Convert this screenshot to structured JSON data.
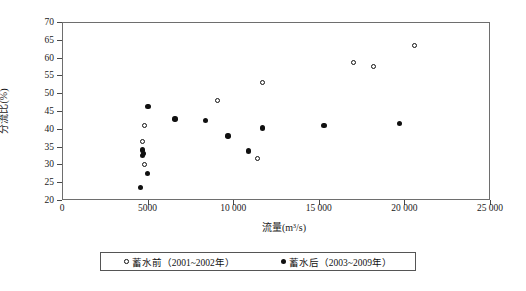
{
  "chart_data": {
    "type": "scatter",
    "title": "",
    "xlabel": "流量(m³/s)",
    "ylabel": "分流比(%)",
    "xlim": [
      0,
      25000
    ],
    "ylim": [
      20,
      70
    ],
    "xticks": [
      0,
      5000,
      10000,
      15000,
      20000,
      25000
    ],
    "xtick_labels": [
      "0",
      "5000",
      "10 000",
      "15 000",
      "20 000",
      "25 000"
    ],
    "yticks": [
      20,
      25,
      30,
      35,
      40,
      45,
      50,
      55,
      60,
      65,
      70
    ],
    "ytick_labels": [
      "20",
      "25",
      "30",
      "35",
      "40",
      "45",
      "50",
      "55",
      "60",
      "65",
      "70"
    ],
    "grid": false,
    "legend_position": "below-axes",
    "series": [
      {
        "name": "蓄水前（2001~2002年）",
        "marker": "open-circle",
        "color": "#101010",
        "points": [
          {
            "x": 4800,
            "y": 41.0
          },
          {
            "x": 4730,
            "y": 36.5
          },
          {
            "x": 4800,
            "y": 30.0
          },
          {
            "x": 9100,
            "y": 48.0
          },
          {
            "x": 11400,
            "y": 31.7
          },
          {
            "x": 11700,
            "y": 53.0
          },
          {
            "x": 17000,
            "y": 58.5
          },
          {
            "x": 18200,
            "y": 57.5
          },
          {
            "x": 20600,
            "y": 63.5
          }
        ]
      },
      {
        "name": "蓄水后（2003~2009年）",
        "marker": "filled-circle",
        "color": "#101010",
        "points": [
          {
            "x": 5020,
            "y": 46.2
          },
          {
            "x": 4700,
            "y": 34.0
          },
          {
            "x": 4760,
            "y": 33.0
          },
          {
            "x": 4720,
            "y": 32.5
          },
          {
            "x": 5000,
            "y": 27.5
          },
          {
            "x": 4600,
            "y": 23.5
          },
          {
            "x": 6600,
            "y": 42.7
          },
          {
            "x": 8400,
            "y": 42.3
          },
          {
            "x": 9700,
            "y": 38.0
          },
          {
            "x": 10900,
            "y": 33.8
          },
          {
            "x": 11700,
            "y": 40.2
          },
          {
            "x": 15300,
            "y": 41.0
          },
          {
            "x": 19700,
            "y": 41.5
          }
        ]
      }
    ]
  },
  "legend": {
    "entries": [
      {
        "marker": "open-circle",
        "label": "蓄水前（2001~2002年）"
      },
      {
        "marker": "filled-circle",
        "label": "蓄水后（2003~2009年）"
      }
    ]
  }
}
